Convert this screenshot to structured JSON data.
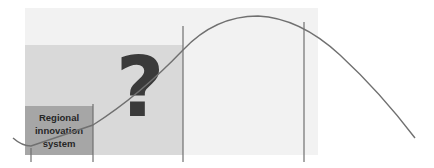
{
  "diagram": {
    "box_label_lines": [
      "Regional",
      "innovation",
      "system"
    ],
    "center_symbol": "?",
    "colors": {
      "outer_panel": "#f2f2f2",
      "middle_panel": "#d9d9d9",
      "label_box": "#a6a6a6",
      "curve": "#707070",
      "divider_lines": "#707070",
      "question_mark": "#3a3a3a"
    }
  }
}
